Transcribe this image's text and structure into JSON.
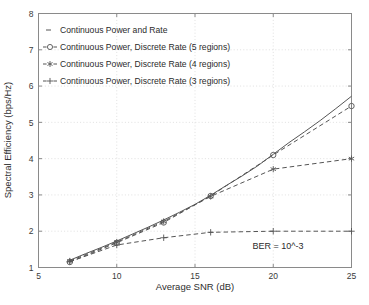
{
  "chart_data": {
    "type": "line",
    "title": "",
    "xlabel": "Average SNR (dB)",
    "ylabel": "Spectral Efficiency (bps/Hz)",
    "xlim": [
      5,
      25
    ],
    "ylim": [
      1,
      8
    ],
    "xticks": [
      5,
      10,
      15,
      20,
      25
    ],
    "xticklabels": [
      "5",
      "10",
      "15",
      "20",
      "25"
    ],
    "yticks": [
      1,
      2,
      3,
      4,
      5,
      6,
      7,
      8
    ],
    "yticklabels": [
      "1",
      "2",
      "3",
      "4",
      "5",
      "6",
      "7",
      "8"
    ],
    "grid": true,
    "grid_style": "dotted",
    "legend_position": "upper left",
    "annotations": [
      {
        "text": "BER = 10^-3",
        "x": 21.3,
        "y": 1.55
      }
    ],
    "series": [
      {
        "name": "Continuous Power and Rate",
        "legend_marker": "-",
        "linestyle": "solid",
        "marker": "none",
        "color": "#555555",
        "x": [
          7,
          8,
          9,
          10,
          11,
          12,
          13,
          14,
          15,
          16,
          17,
          18,
          19,
          20,
          21,
          22,
          23,
          24,
          25
        ],
        "y": [
          1.2,
          1.38,
          1.55,
          1.73,
          1.92,
          2.11,
          2.31,
          2.52,
          2.74,
          2.99,
          3.26,
          3.52,
          3.8,
          4.12,
          4.44,
          4.74,
          5.05,
          5.38,
          5.72
        ]
      },
      {
        "name": "Continuous Power, Discrete Rate (5 regions)",
        "legend_marker": "-o-",
        "linestyle": "dashed",
        "marker": "circle",
        "color": "#555555",
        "x": [
          7,
          10,
          13,
          16,
          20,
          25
        ],
        "y": [
          1.15,
          1.68,
          2.24,
          2.97,
          4.1,
          5.45
        ]
      },
      {
        "name": "Continuous Power, Discrete Rate (4 regions)",
        "legend_marker": "-*-",
        "linestyle": "dashed",
        "marker": "star",
        "color": "#555555",
        "x": [
          7,
          10,
          13,
          16,
          20,
          25
        ],
        "y": [
          1.18,
          1.7,
          2.27,
          2.96,
          3.71,
          4.0
        ]
      },
      {
        "name": "Continuous Power, Discrete Rate (3 regions)",
        "legend_marker": "-+-",
        "linestyle": "dashed",
        "marker": "plus",
        "color": "#555555",
        "x": [
          7,
          10,
          13,
          16,
          20,
          25
        ],
        "y": [
          1.16,
          1.62,
          1.82,
          1.97,
          2.0,
          2.0
        ]
      }
    ]
  },
  "legend": {
    "entries": [
      {
        "marker": "-",
        "label": "Continuous Power and Rate"
      },
      {
        "marker": "-o-",
        "label": "Continuous Power, Discrete Rate (5 regions)"
      },
      {
        "marker": "-*-",
        "label": "Continuous Power, Discrete Rate (4 regions)"
      },
      {
        "marker": "-+-",
        "label": "Continuous Power, Discrete Rate (3 regions)"
      }
    ]
  },
  "axes": {
    "xlabel": "Average SNR (dB)",
    "ylabel": "Spectral Efficiency (bps/Hz)",
    "xticklabels": [
      "5",
      "10",
      "15",
      "20",
      "25"
    ],
    "yticklabels": [
      "1",
      "2",
      "3",
      "4",
      "5",
      "6",
      "7",
      "8"
    ]
  },
  "annotation": {
    "ber": "BER = 10^-3"
  },
  "colors": {
    "line": "#555555",
    "axis": "#8a8a8a",
    "grid": "#d8d8d8",
    "text": "#2b2b2b",
    "background": "#ffffff"
  }
}
